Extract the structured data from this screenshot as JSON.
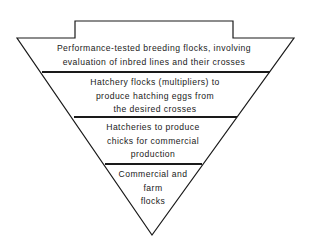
{
  "diagram": {
    "type": "inverted-pyramid",
    "colors": {
      "stroke": "#1a1a1a",
      "background": "#ffffff"
    },
    "tiers": [
      {
        "lines": [
          "Performance-tested breeding flocks, involving",
          "evaluation of inbred lines and their crosses"
        ]
      },
      {
        "lines": [
          "Hatchery flocks (multipliers) to",
          "produce hatching eggs from",
          "the desired crosses"
        ]
      },
      {
        "lines": [
          "Hatcheries to produce",
          "chicks for commercial",
          "production"
        ]
      },
      {
        "lines": [
          "Commercial and",
          "farm",
          "flocks"
        ]
      }
    ]
  }
}
